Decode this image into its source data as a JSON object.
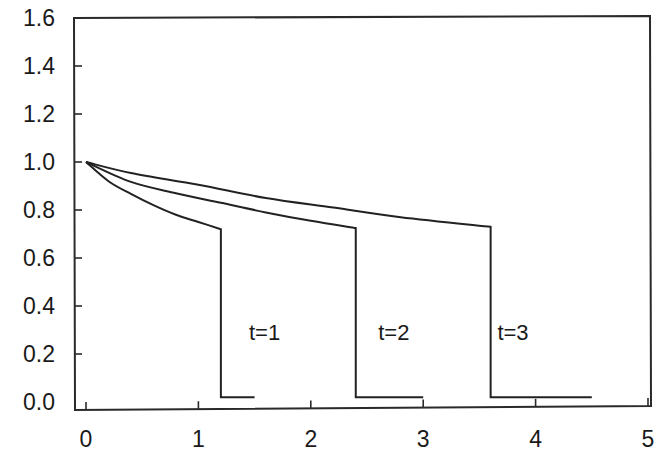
{
  "chart_data": {
    "type": "line",
    "title": "",
    "xlabel": "",
    "ylabel": "",
    "xlim": [
      -0.1,
      5.0
    ],
    "ylim": [
      -0.03,
      1.6
    ],
    "grid": false,
    "legend": null,
    "x_ticks": [
      "0",
      "1",
      "2",
      "3",
      "4",
      "5"
    ],
    "y_ticks": [
      "0.0",
      "0.2",
      "0.4",
      "0.6",
      "0.8",
      "1.0",
      "1.2",
      "1.4",
      "1.6"
    ],
    "series": [
      {
        "name": "t=1",
        "label": "t=1",
        "label_pos": [
          1.45,
          0.26
        ],
        "points": [
          [
            0,
            1.0
          ],
          [
            0.2,
            0.92
          ],
          [
            0.4,
            0.867
          ],
          [
            0.6,
            0.82
          ],
          [
            0.8,
            0.78
          ],
          [
            1.0,
            0.75
          ],
          [
            1.2,
            0.72
          ],
          [
            1.2,
            0.02
          ],
          [
            1.5,
            0.02
          ]
        ]
      },
      {
        "name": "t=2",
        "label": "t=2",
        "label_pos": [
          2.6,
          0.26
        ],
        "points": [
          [
            0,
            1.0
          ],
          [
            0.4,
            0.917
          ],
          [
            0.8,
            0.87
          ],
          [
            1.2,
            0.83
          ],
          [
            1.6,
            0.79
          ],
          [
            2.0,
            0.755
          ],
          [
            2.4,
            0.725
          ],
          [
            2.4,
            0.02
          ],
          [
            3.0,
            0.02
          ]
        ]
      },
      {
        "name": "t=3",
        "label": "t=3",
        "label_pos": [
          3.66,
          0.26
        ],
        "points": [
          [
            0,
            1.0
          ],
          [
            0.4,
            0.954
          ],
          [
            1.0,
            0.905
          ],
          [
            1.6,
            0.85
          ],
          [
            2.2,
            0.81
          ],
          [
            2.8,
            0.77
          ],
          [
            3.6,
            0.73
          ],
          [
            3.6,
            0.02
          ],
          [
            4.5,
            0.02
          ]
        ]
      }
    ]
  }
}
